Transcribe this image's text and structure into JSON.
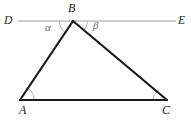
{
  "figure": {
    "kind": "plane-geometry-diagram",
    "width": 191,
    "height": 120,
    "background_color": "#ffffff"
  },
  "colors": {
    "triangle_stroke": "#1a1a1a",
    "line_de_stroke": "#9a9a9a",
    "arc_stroke": "#a8a8a8",
    "vertex_label_color": "#141414",
    "angle_label_color": "#6e6e6e"
  },
  "points": {
    "A": {
      "label": "A",
      "x": 20,
      "y": 100,
      "label_x": 20,
      "label_y": 105
    },
    "B": {
      "label": "B",
      "x": 73,
      "y": 21,
      "label_x": 69,
      "label_y": 2
    },
    "C": {
      "label": "C",
      "x": 167,
      "y": 100,
      "label_x": 163,
      "label_y": 105
    },
    "D": {
      "label": "D",
      "x": 18,
      "y": 21,
      "label_x": 5,
      "label_y": 15
    },
    "E": {
      "label": "E",
      "x": 176,
      "y": 21,
      "label_x": 179,
      "label_y": 15
    }
  },
  "segments": [
    {
      "name": "line-DE",
      "from": "D",
      "to": "E",
      "stroke": "#9a9a9a",
      "width": 1
    },
    {
      "name": "side-AB",
      "from": "A",
      "to": "B",
      "stroke": "#1a1a1a",
      "width": 2.2
    },
    {
      "name": "side-BC",
      "from": "B",
      "to": "C",
      "stroke": "#1a1a1a",
      "width": 2.2
    },
    {
      "name": "side-AC",
      "from": "A",
      "to": "C",
      "stroke": "#1a1a1a",
      "width": 2.2
    }
  ],
  "angles": [
    {
      "name": "angle-alpha",
      "label": "α",
      "at_vertex": "B",
      "between": [
        "D",
        "A"
      ],
      "label_x": 45,
      "label_y": 22
    },
    {
      "name": "angle-beta",
      "label": "β",
      "at_vertex": "B",
      "between": [
        "C",
        "E"
      ],
      "label_x": 93,
      "label_y": 21
    },
    {
      "name": "angle-A",
      "label": "",
      "at_vertex": "A",
      "between": [
        "B",
        "C"
      ],
      "label_x": 0,
      "label_y": 0
    },
    {
      "name": "angle-C",
      "label": "",
      "at_vertex": "C",
      "between": [
        "A",
        "B"
      ],
      "label_x": 0,
      "label_y": 0
    }
  ],
  "arcs": {
    "alpha_path": "M 62.5 26 A 13 13 0 0 0 64.6 30.5",
    "beta_path": "M 85.5 21 A 13 13 0 0 1 82.2 29.4",
    "vertex_A_path": "M 33 100 A 13 13 0 0 0 27.5 89.5",
    "vertex_C_path": "M 154 100 A 13 13 0 0 1 158.8 90.6",
    "apex_left_path": "M 60 21 A 13 13 0 0 0 65.8 31.8",
    "apex_right_path": "M 86 21 A 13 13 0 0 1 81.4 29.8"
  }
}
